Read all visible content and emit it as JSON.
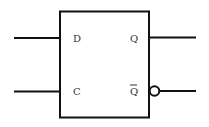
{
  "diagram": {
    "component": "d-flip-flop",
    "inputs": [
      {
        "label": "D"
      },
      {
        "label": "C"
      }
    ],
    "outputs": [
      {
        "label": "Q",
        "inverted": false
      },
      {
        "label": "Q",
        "overbar": true,
        "inverted": true
      }
    ],
    "colors": {
      "stroke": "#111111",
      "label": "#333333",
      "background": "#ffffff"
    }
  }
}
